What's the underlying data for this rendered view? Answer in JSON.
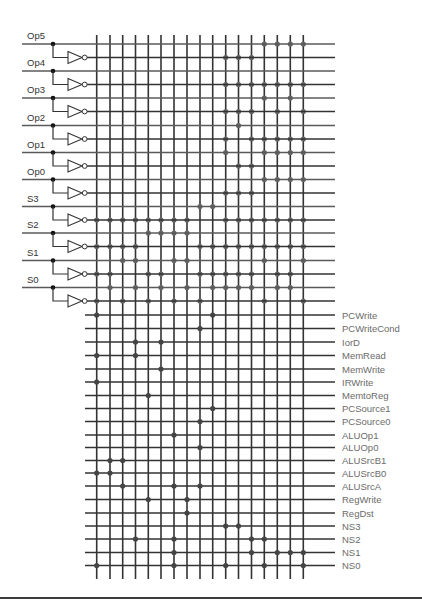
{
  "diagram": {
    "type": "PLA control unit (AND plane / OR plane)",
    "colors": {
      "line": "#333333",
      "true_input_line": "#5a5a5a",
      "and_dot": "#666666",
      "or_dot": "#444444",
      "junction_dot": "#111111",
      "input_label": "#333333",
      "output_label": "#6b6b6b"
    },
    "columns_x": [
      96.7,
      110,
      122.7,
      135.5,
      148.3,
      161,
      174,
      187,
      200,
      212.7,
      225.7,
      238.5,
      251.5,
      264.3,
      277.3,
      290.3,
      303.3
    ],
    "inputs": [
      {
        "label": "Op5",
        "y": 44
      },
      {
        "label": "Op4",
        "y": 71
      },
      {
        "label": "Op3",
        "y": 98
      },
      {
        "label": "Op2",
        "y": 125.5
      },
      {
        "label": "Op1",
        "y": 152.5
      },
      {
        "label": "Op0",
        "y": 179.5
      },
      {
        "label": "S3",
        "y": 206.5
      },
      {
        "label": "S2",
        "y": 233
      },
      {
        "label": "S1",
        "y": 260.5
      },
      {
        "label": "S0",
        "y": 287.5
      }
    ],
    "inverted_offset": 13.5,
    "and_plane": [
      {
        "row": "Op5",
        "cols": [
          13,
          14,
          15,
          16
        ]
      },
      {
        "row": "Op5'",
        "cols": [
          10,
          11,
          12
        ]
      },
      {
        "row": "Op4",
        "cols": []
      },
      {
        "row": "Op4'",
        "cols": [
          10,
          11,
          12,
          13,
          14,
          15,
          16
        ]
      },
      {
        "row": "Op3",
        "cols": [
          13,
          15
        ]
      },
      {
        "row": "Op3'",
        "cols": [
          10,
          11,
          12,
          14,
          16
        ]
      },
      {
        "row": "Op2",
        "cols": [
          11
        ]
      },
      {
        "row": "Op2'",
        "cols": [
          10,
          12,
          13,
          14,
          15,
          16
        ]
      },
      {
        "row": "Op1",
        "cols": [
          10,
          13,
          14,
          15,
          16
        ]
      },
      {
        "row": "Op1'",
        "cols": [
          11,
          12
        ]
      },
      {
        "row": "Op0",
        "cols": [
          13,
          14,
          15,
          16
        ]
      },
      {
        "row": "Op0'",
        "cols": [
          10,
          11,
          12
        ]
      },
      {
        "row": "S3",
        "cols": [
          8,
          9
        ]
      },
      {
        "row": "S3'",
        "cols": [
          0,
          1,
          2,
          3,
          4,
          5,
          6,
          7,
          10,
          11,
          12,
          13,
          14,
          15,
          16
        ]
      },
      {
        "row": "S2",
        "cols": [
          4,
          5,
          6,
          7
        ]
      },
      {
        "row": "S2'",
        "cols": [
          0,
          1,
          2,
          3,
          8,
          9,
          10,
          11,
          12,
          13,
          14,
          15,
          16
        ]
      },
      {
        "row": "S1",
        "cols": [
          2,
          3,
          6,
          7,
          13,
          16
        ]
      },
      {
        "row": "S1'",
        "cols": [
          0,
          1,
          4,
          5,
          8,
          9,
          10,
          11,
          12,
          14,
          15
        ]
      },
      {
        "row": "S0",
        "cols": [
          1,
          3,
          5,
          7,
          9,
          10,
          11,
          12,
          14,
          15
        ]
      },
      {
        "row": "S0'",
        "cols": [
          0,
          2,
          4,
          6,
          8,
          13,
          16
        ]
      }
    ],
    "outputs": [
      {
        "label": "PCWrite",
        "y": 315,
        "cols": [
          0,
          9
        ]
      },
      {
        "label": "PCWriteCond",
        "y": 328.5,
        "cols": [
          8
        ]
      },
      {
        "label": "IorD",
        "y": 342,
        "cols": [
          3,
          5
        ]
      },
      {
        "label": "MemRead",
        "y": 355.5,
        "cols": [
          0,
          3
        ]
      },
      {
        "label": "MemWrite",
        "y": 369,
        "cols": [
          5
        ]
      },
      {
        "label": "IRWrite",
        "y": 382,
        "cols": [
          0
        ]
      },
      {
        "label": "MemtoReg",
        "y": 395.5,
        "cols": [
          4
        ]
      },
      {
        "label": "PCSource1",
        "y": 408.5,
        "cols": [
          9
        ]
      },
      {
        "label": "PCSource0",
        "y": 421.5,
        "cols": [
          8
        ]
      },
      {
        "label": "ALUOp1",
        "y": 435,
        "cols": [
          6
        ]
      },
      {
        "label": "ALUOp0",
        "y": 447.5,
        "cols": [
          8
        ]
      },
      {
        "label": "ALUSrcB1",
        "y": 460.5,
        "cols": [
          1,
          2
        ]
      },
      {
        "label": "ALUSrcB0",
        "y": 473,
        "cols": [
          0,
          1
        ]
      },
      {
        "label": "ALUSrcA",
        "y": 486,
        "cols": [
          2,
          6,
          8
        ]
      },
      {
        "label": "RegWrite",
        "y": 499.5,
        "cols": [
          4,
          7
        ]
      },
      {
        "label": "RegDst",
        "y": 513,
        "cols": [
          7
        ]
      },
      {
        "label": "NS3",
        "y": 526,
        "cols": [
          10,
          11
        ]
      },
      {
        "label": "NS2",
        "y": 539,
        "cols": [
          3,
          6,
          12,
          13
        ]
      },
      {
        "label": "NS1",
        "y": 552.5,
        "cols": [
          6,
          12,
          14,
          15,
          16
        ]
      },
      {
        "label": "NS0",
        "y": 565.5,
        "cols": [
          0,
          6,
          10,
          13,
          16
        ]
      }
    ],
    "geometry": {
      "input_line_start_x": 22,
      "junction_x": 53,
      "inverter_x": 68,
      "inverter_w": 14,
      "inverter_h": 12,
      "bubble_r": 2.4,
      "and_line_end_x": 335,
      "or_line_start_x": 85,
      "or_line_end_x": 335,
      "column_top_y": 35,
      "column_bottom_y": 579,
      "label_left_x": 27,
      "label_right_x": 342
    }
  }
}
